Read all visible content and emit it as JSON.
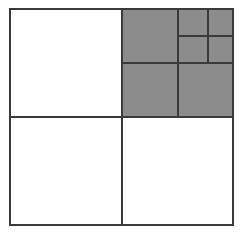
{
  "figure": {
    "name": "quadtree-subdivision-diagram",
    "type": "quadtree",
    "title": "",
    "background_color": "#ffffff",
    "line_color": "#3a3a3a",
    "fill_colors": {
      "empty": "#ffffff",
      "filled": "#8c8c8c"
    },
    "canvas": {
      "width": 243,
      "height": 235
    },
    "root_bounds": {
      "x": 10,
      "y": 9,
      "width": 223,
      "height": 216
    },
    "max_depth": 3,
    "leaf_count": 10,
    "filled_leaf_count": 6,
    "empty_leaf_count": 4
  },
  "splits": [
    {
      "depth": 1,
      "label": "root-split",
      "center_x": 122,
      "center_y": 117,
      "x1": 10,
      "x2": 233,
      "y1": 9,
      "y2": 225,
      "stroke_width": 2.1
    },
    {
      "depth": 2,
      "label": "top-right-quadrant-split",
      "center_x": 178,
      "center_y": 63,
      "x1": 122,
      "x2": 233,
      "y1": 9,
      "y2": 117,
      "stroke_width": 2.0
    },
    {
      "depth": 3,
      "label": "top-right-top-right-subcell-split",
      "center_x": 208,
      "center_y": 36,
      "x1": 178,
      "x2": 233,
      "y1": 9,
      "y2": 63,
      "stroke_width": 1.9
    }
  ],
  "cells": [
    {
      "id": "nw",
      "label": "top-left-quadrant",
      "depth": 1,
      "state": "empty",
      "fill": "#ffffff",
      "x": 10,
      "y": 9,
      "width": 112,
      "height": 108
    },
    {
      "id": "sw",
      "label": "bottom-left-quadrant",
      "depth": 1,
      "state": "empty",
      "fill": "#ffffff",
      "x": 10,
      "y": 117,
      "width": 112,
      "height": 108
    },
    {
      "id": "se",
      "label": "bottom-right-quadrant",
      "depth": 1,
      "state": "empty",
      "fill": "#ffffff",
      "x": 122,
      "y": 117,
      "width": 111,
      "height": 108
    },
    {
      "id": "ne-nw",
      "label": "top-right-top-left-subcell",
      "depth": 2,
      "state": "filled",
      "fill": "#8c8c8c",
      "x": 122,
      "y": 9,
      "width": 56,
      "height": 54
    },
    {
      "id": "ne-sw",
      "label": "top-right-bottom-left-subcell",
      "depth": 2,
      "state": "filled",
      "fill": "#8c8c8c",
      "x": 122,
      "y": 63,
      "width": 56,
      "height": 54
    },
    {
      "id": "ne-se",
      "label": "top-right-bottom-right-subcell",
      "depth": 2,
      "state": "filled",
      "fill": "#8c8c8c",
      "x": 178,
      "y": 63,
      "width": 55,
      "height": 54
    },
    {
      "id": "ne-ne-nw",
      "label": "top-right-top-right-top-left-leaf",
      "depth": 3,
      "state": "filled",
      "fill": "#8c8c8c",
      "x": 178,
      "y": 9,
      "width": 30,
      "height": 27
    },
    {
      "id": "ne-ne-ne",
      "label": "top-right-top-right-top-right-leaf",
      "depth": 3,
      "state": "filled",
      "fill": "#8c8c8c",
      "x": 208,
      "y": 9,
      "width": 25,
      "height": 27
    },
    {
      "id": "ne-ne-sw",
      "label": "top-right-top-right-bottom-left-leaf",
      "depth": 3,
      "state": "filled",
      "fill": "#8c8c8c",
      "x": 178,
      "y": 36,
      "width": 30,
      "height": 27
    },
    {
      "id": "ne-ne-se",
      "label": "top-right-top-right-bottom-right-leaf",
      "depth": 3,
      "state": "filled",
      "fill": "#8c8c8c",
      "x": 208,
      "y": 36,
      "width": 25,
      "height": 27
    }
  ]
}
